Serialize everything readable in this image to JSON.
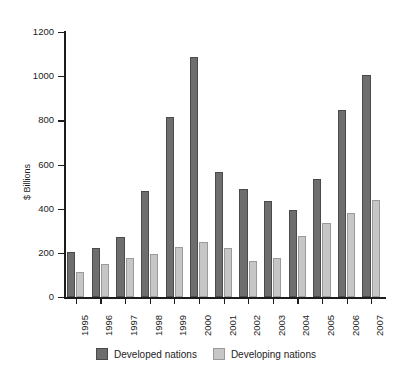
{
  "chart_data": {
    "type": "bar",
    "title": "",
    "subtitle": "",
    "xlabel": "",
    "ylabel": "$ Billions",
    "categories": [
      "1995",
      "1996",
      "1997",
      "1998",
      "1999",
      "2000",
      "2001",
      "2002",
      "2003",
      "2004",
      "2005",
      "2006",
      "2007"
    ],
    "series": [
      {
        "name": "Developed nations",
        "color": "#6e6e6e",
        "values": [
          205,
          220,
          270,
          480,
          815,
          1085,
          565,
          490,
          435,
          395,
          535,
          845,
          1005
        ]
      },
      {
        "name": "Developing nations",
        "color": "#c6c6c6",
        "values": [
          115,
          150,
          175,
          195,
          225,
          250,
          220,
          165,
          175,
          275,
          335,
          380,
          440
        ]
      }
    ],
    "ylim": [
      0,
      1200
    ],
    "y_ticks": [
      0,
      200,
      400,
      600,
      800,
      1000,
      1200
    ],
    "y_tick_labels": [
      "0",
      "200",
      "400",
      "600",
      "800",
      "1000",
      "1200"
    ],
    "grid": false,
    "legend_position": "bottom"
  },
  "legend": {
    "items": [
      {
        "label": "Developed nations",
        "color": "#6e6e6e"
      },
      {
        "label": "Developing nations",
        "color": "#c6c6c6"
      }
    ]
  },
  "axes": {
    "y_title": "$ Billions"
  },
  "colors": {
    "developed": "#6e6e6e",
    "developing": "#c6c6c6",
    "axis": "#1c1c1c",
    "background": "#ffffff"
  }
}
